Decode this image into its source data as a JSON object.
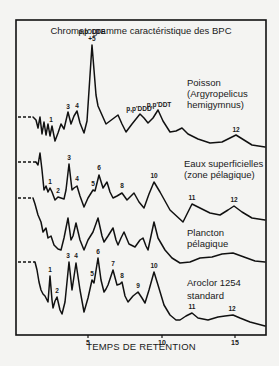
{
  "chart_data": {
    "type": "line",
    "title": "Chromatogramme caractéristique des BPC",
    "xlabel": "TEMPS DE RETENTION",
    "ylabel": "",
    "x_ticks": [
      5,
      10,
      15
    ],
    "xlim": [
      0,
      17
    ],
    "grid": false,
    "legend": "inline labels right of each trace",
    "series": [
      {
        "name": "Poisson (Argyropelicus hemigymnus)",
        "label_lines": [
          "Poisson",
          "(Argyropelicus",
          "hemigymnus)"
        ],
        "baseline_dashed": [
          [
            18,
            117
          ],
          [
            33,
            117
          ]
        ],
        "points": [
          [
            33,
            117
          ],
          [
            36,
            120
          ],
          [
            38,
            128
          ],
          [
            40,
            117
          ],
          [
            42,
            134
          ],
          [
            44,
            122
          ],
          [
            46,
            135
          ],
          [
            48,
            124
          ],
          [
            50,
            136
          ],
          [
            52,
            126
          ],
          [
            55,
            141
          ],
          [
            58,
            133
          ],
          [
            61,
            124
          ],
          [
            64,
            129
          ],
          [
            68,
            112
          ],
          [
            71,
            124
          ],
          [
            74,
            116
          ],
          [
            77,
            111
          ],
          [
            80,
            123
          ],
          [
            84,
            133
          ],
          [
            87,
            121
          ],
          [
            92,
            45
          ],
          [
            96,
            95
          ],
          [
            98,
            106
          ],
          [
            102,
            115
          ],
          [
            106,
            124
          ],
          [
            110,
            121
          ],
          [
            118,
            115
          ],
          [
            122,
            124
          ],
          [
            126,
            132
          ],
          [
            132,
            124
          ],
          [
            140,
            114
          ],
          [
            144,
            118
          ],
          [
            148,
            123
          ],
          [
            153,
            118
          ],
          [
            158,
            110
          ],
          [
            163,
            121
          ],
          [
            170,
            132
          ],
          [
            176,
            131
          ],
          [
            182,
            128
          ],
          [
            188,
            134
          ],
          [
            198,
            139
          ],
          [
            210,
            143
          ],
          [
            222,
            142
          ],
          [
            230,
            138
          ],
          [
            236,
            135
          ],
          [
            244,
            140
          ],
          [
            252,
            145
          ],
          [
            265,
            147
          ]
        ],
        "peaks": [
          {
            "label": "1",
            "x": 51,
            "y": 124
          },
          {
            "label": "3",
            "x": 68,
            "y": 111
          },
          {
            "label": "4",
            "x": 77,
            "y": 110
          },
          {
            "label_lines": [
              "p,p' DDE",
              "+5"
            ],
            "x": 92,
            "y": 44
          },
          {
            "label": "p,p'DDD",
            "x": 139,
            "y": 113
          },
          {
            "label": "p,p'DDT",
            "x": 159,
            "y": 109
          },
          {
            "label": "12",
            "x": 236,
            "y": 134
          }
        ]
      },
      {
        "name": "Eaux superficielles (zone pélagique)",
        "label_lines": [
          "Eaux superficielles",
          "(zone  pélagique)"
        ],
        "baseline_dashed": [
          [
            18,
            162
          ],
          [
            36,
            162
          ]
        ],
        "points": [
          [
            36,
            162
          ],
          [
            38,
            165
          ],
          [
            40,
            153
          ],
          [
            42,
            170
          ],
          [
            44,
            190
          ],
          [
            46,
            186
          ],
          [
            48,
            192
          ],
          [
            50,
            188
          ],
          [
            52,
            192
          ],
          [
            55,
            200
          ],
          [
            58,
            197
          ],
          [
            61,
            198
          ],
          [
            64,
            199
          ],
          [
            66,
            190
          ],
          [
            69,
            164
          ],
          [
            72,
            190
          ],
          [
            74,
            188
          ],
          [
            77,
            186
          ],
          [
            80,
            196
          ],
          [
            84,
            207
          ],
          [
            88,
            198
          ],
          [
            93,
            190
          ],
          [
            95,
            191
          ],
          [
            99,
            175
          ],
          [
            103,
            188
          ],
          [
            107,
            182
          ],
          [
            110,
            192
          ],
          [
            113,
            198
          ],
          [
            117,
            196
          ],
          [
            122,
            193
          ],
          [
            127,
            200
          ],
          [
            134,
            193
          ],
          [
            139,
            202
          ],
          [
            144,
            208
          ],
          [
            149,
            194
          ],
          [
            154,
            182
          ],
          [
            160,
            192
          ],
          [
            170,
            210
          ],
          [
            183,
            222
          ],
          [
            188,
            212
          ],
          [
            192,
            204
          ],
          [
            198,
            207
          ],
          [
            210,
            213
          ],
          [
            220,
            215
          ],
          [
            228,
            210
          ],
          [
            234,
            206
          ],
          [
            242,
            212
          ],
          [
            252,
            218
          ],
          [
            265,
            220
          ]
        ],
        "peaks": [
          {
            "label": "1",
            "x": 50,
            "y": 186
          },
          {
            "label": "2",
            "x": 58,
            "y": 195
          },
          {
            "label": "3",
            "x": 69,
            "y": 162
          },
          {
            "label": "4",
            "x": 77,
            "y": 183
          },
          {
            "label": "5",
            "x": 93,
            "y": 188
          },
          {
            "label": "6",
            "x": 99,
            "y": 172
          },
          {
            "label": "8",
            "x": 122,
            "y": 190
          },
          {
            "label": "10",
            "x": 154,
            "y": 180
          },
          {
            "label": "11",
            "x": 192,
            "y": 202
          },
          {
            "label": "12",
            "x": 234,
            "y": 204
          }
        ]
      },
      {
        "name": "Plancton pélagique",
        "label_lines": [
          "Plancton",
          "pélagique"
        ],
        "baseline_dashed": [
          [
            18,
            198
          ],
          [
            33,
            198
          ]
        ],
        "points": [
          [
            33,
            198
          ],
          [
            35,
            204
          ],
          [
            38,
            215
          ],
          [
            41,
            222
          ],
          [
            43,
            232
          ],
          [
            46,
            228
          ],
          [
            48,
            238
          ],
          [
            51,
            236
          ],
          [
            54,
            245
          ],
          [
            58,
            249
          ],
          [
            61,
            250
          ],
          [
            64,
            238
          ],
          [
            68,
            218
          ],
          [
            71,
            240
          ],
          [
            73,
            236
          ],
          [
            76,
            223
          ],
          [
            80,
            240
          ],
          [
            84,
            250
          ],
          [
            88,
            240
          ],
          [
            93,
            232
          ],
          [
            98,
            218
          ],
          [
            102,
            236
          ],
          [
            104,
            242
          ],
          [
            108,
            236
          ],
          [
            113,
            228
          ],
          [
            116,
            240
          ],
          [
            118,
            245
          ],
          [
            121,
            238
          ],
          [
            124,
            232
          ],
          [
            129,
            244
          ],
          [
            135,
            247
          ],
          [
            140,
            240
          ],
          [
            143,
            238
          ],
          [
            146,
            246
          ],
          [
            148,
            250
          ],
          [
            151,
            236
          ],
          [
            154,
            222
          ],
          [
            158,
            238
          ],
          [
            165,
            250
          ],
          [
            172,
            258
          ],
          [
            180,
            263
          ],
          [
            190,
            262
          ],
          [
            200,
            258
          ],
          [
            212,
            257
          ],
          [
            222,
            254
          ],
          [
            233,
            253
          ],
          [
            244,
            257
          ],
          [
            255,
            261
          ],
          [
            265,
            262
          ]
        ],
        "peaks": []
      },
      {
        "name": "Aroclor 1254 standard",
        "label_lines": [
          "Aroclor 1254",
          "standard"
        ],
        "baseline_dashed": [
          [
            18,
            262
          ],
          [
            35,
            262
          ]
        ],
        "points": [
          [
            35,
            262
          ],
          [
            37,
            270
          ],
          [
            39,
            282
          ],
          [
            41,
            290
          ],
          [
            43,
            294
          ],
          [
            45,
            296
          ],
          [
            48,
            302
          ],
          [
            50,
            276
          ],
          [
            52,
            300
          ],
          [
            53,
            308
          ],
          [
            55,
            301
          ],
          [
            57,
            297
          ],
          [
            60,
            310
          ],
          [
            62,
            314
          ],
          [
            65,
            302
          ],
          [
            69,
            262
          ],
          [
            72,
            290
          ],
          [
            76,
            263
          ],
          [
            80,
            290
          ],
          [
            84,
            312
          ],
          [
            88,
            298
          ],
          [
            92,
            280
          ],
          [
            94,
            283
          ],
          [
            98,
            258
          ],
          [
            101,
            280
          ],
          [
            104,
            292
          ],
          [
            106,
            289
          ],
          [
            108,
            285
          ],
          [
            113,
            270
          ],
          [
            117,
            285
          ],
          [
            120,
            284
          ],
          [
            122,
            282
          ],
          [
            125,
            296
          ],
          [
            128,
            302
          ],
          [
            133,
            296
          ],
          [
            138,
            292
          ],
          [
            142,
            298
          ],
          [
            145,
            303
          ],
          [
            149,
            290
          ],
          [
            154,
            272
          ],
          [
            158,
            285
          ],
          [
            164,
            305
          ],
          [
            170,
            315
          ],
          [
            176,
            320
          ],
          [
            180,
            320
          ],
          [
            186,
            316
          ],
          [
            192,
            313
          ],
          [
            198,
            318
          ],
          [
            208,
            320
          ],
          [
            218,
            317
          ],
          [
            225,
            316
          ],
          [
            233,
            315
          ],
          [
            240,
            318
          ],
          [
            250,
            322
          ],
          [
            265,
            326
          ]
        ],
        "peaks": [
          {
            "label": "1",
            "x": 50,
            "y": 274
          },
          {
            "label": "2",
            "x": 57,
            "y": 295
          },
          {
            "label": "3",
            "x": 68,
            "y": 260
          },
          {
            "label": "4",
            "x": 76,
            "y": 260
          },
          {
            "label": "5",
            "x": 92,
            "y": 278
          },
          {
            "label": "6",
            "x": 98,
            "y": 256
          },
          {
            "label": "7",
            "x": 113,
            "y": 268
          },
          {
            "label": "8",
            "x": 122,
            "y": 280
          },
          {
            "label": "9",
            "x": 138,
            "y": 290
          },
          {
            "label": "10",
            "x": 154,
            "y": 270
          },
          {
            "label": "11",
            "x": 192,
            "y": 311
          },
          {
            "label": "12",
            "x": 232,
            "y": 313
          }
        ]
      }
    ]
  },
  "layout": {
    "title_pos": [
      106,
      34
    ],
    "xlabel_pos": [
      92,
      350
    ],
    "frame": {
      "x": 16,
      "y": 20,
      "w": 250,
      "h": 315
    },
    "tick_positions": [
      {
        "value": "5",
        "x": 88
      },
      {
        "value": "10",
        "x": 162
      },
      {
        "value": "15",
        "x": 235
      }
    ],
    "sample_label_pos": [
      {
        "x": 187,
        "y": 86,
        "dy": 11
      },
      {
        "x": 184,
        "y": 167,
        "dy": 11
      },
      {
        "x": 187,
        "y": 236,
        "dy": 11
      },
      {
        "x": 187,
        "y": 286,
        "dy": 13
      }
    ]
  },
  "colors": {
    "ink": "#111111",
    "paper": "#f4f4f2"
  }
}
